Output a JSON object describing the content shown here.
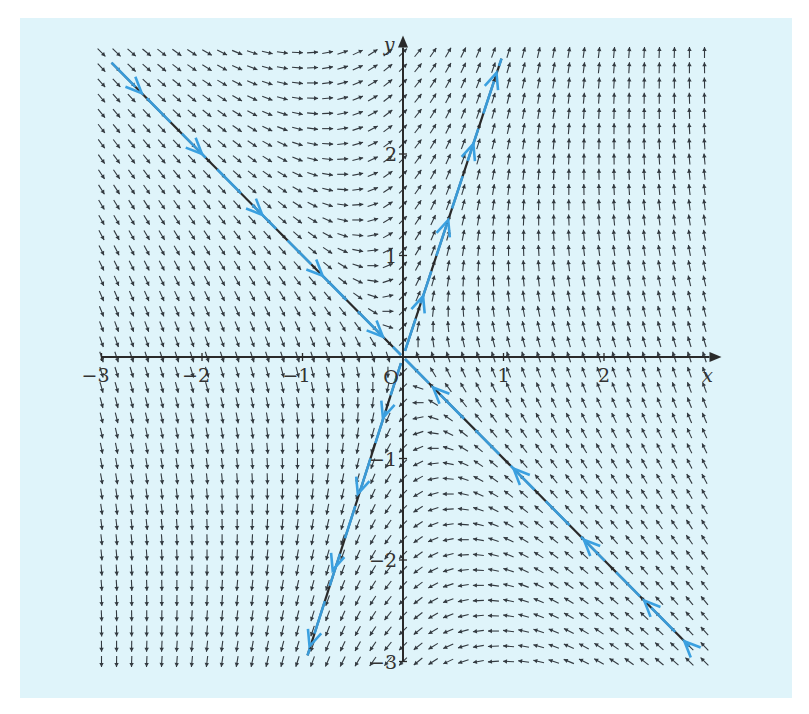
{
  "chart_data": {
    "type": "vector_field",
    "title": "",
    "system": {
      "dx_dt": "-x + y",
      "dy_dt": "3x + y"
    },
    "xlabel": "x",
    "ylabel": "y",
    "origin_label": "O",
    "xlim": [
      -3,
      3
    ],
    "ylim": [
      -3,
      3
    ],
    "x_ticks": [
      {
        "value": -3,
        "label": "−3"
      },
      {
        "value": -2,
        "label": "−2"
      },
      {
        "value": -1,
        "label": "−1"
      },
      {
        "value": 1,
        "label": "1"
      },
      {
        "value": 2,
        "label": "2"
      }
    ],
    "y_ticks": [
      {
        "value": 2,
        "label": "2"
      },
      {
        "value": 1,
        "label": "1"
      },
      {
        "value": -1,
        "label": "−1"
      },
      {
        "value": -2,
        "label": "−2"
      },
      {
        "value": -3,
        "label": "−3"
      }
    ],
    "grid": false,
    "arrow_grid": {
      "nx": 41,
      "ny": 41
    },
    "eigen_lines": [
      {
        "name": "stable",
        "direction": [
          1,
          -1
        ],
        "equation": "y = -x",
        "flow": "toward origin",
        "eigenvalue": -2
      },
      {
        "name": "unstable",
        "direction": [
          1,
          3
        ],
        "equation": "y = 3x",
        "flow": "away from origin",
        "eigenvalue": 2
      }
    ],
    "colors": {
      "background": "#dff4fa",
      "arrows": "#333a40",
      "axes": "#2a2a2a",
      "trajectory": "#3aa0e0"
    }
  }
}
